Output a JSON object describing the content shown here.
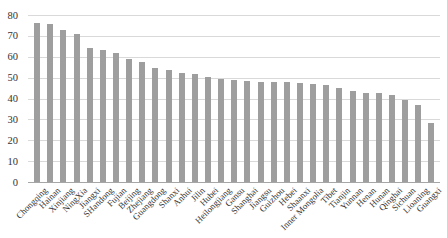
{
  "chart_data": {
    "type": "bar",
    "title": "",
    "xlabel": "",
    "ylabel": "",
    "legend": "none",
    "grid": "horizontal",
    "ylim": [
      0,
      80
    ],
    "y_ticks": [
      0,
      10,
      20,
      30,
      40,
      50,
      60,
      70,
      80
    ],
    "categories": [
      "Chongqing",
      "Hainan",
      "Xinjiang",
      "NingXia",
      "Jiangxi",
      "SHandong",
      "Fujian",
      "Beijing",
      "Zhejiang",
      "Guangdong",
      "Shanxi",
      "Anhui",
      "Jilin",
      "Hubei",
      "Heilongjiang",
      "Gansu",
      "Shanghai",
      "Jiangsu",
      "Guizhou",
      "Hebei",
      "Shaanxi",
      "Inner Mongolia",
      "Tibet",
      "Tianjin",
      "Yunnan",
      "Henan",
      "Hunan",
      "Qinghai",
      "Sichuan",
      "Lioaning",
      "Guangxi"
    ],
    "values": [
      76,
      75.5,
      73,
      71,
      64,
      63,
      62,
      59,
      57.5,
      54.5,
      53.5,
      52,
      51.5,
      50.5,
      49.5,
      49,
      48.5,
      48,
      48,
      48,
      47.5,
      47,
      46.5,
      45,
      43.5,
      42.5,
      42.5,
      41.5,
      39.5,
      37,
      28.5
    ],
    "colors": {
      "bar": "#9e9e9e",
      "gridline": "#d9d9d9",
      "axis_line": "#a6a6a6",
      "tick_text": "#333333"
    }
  }
}
